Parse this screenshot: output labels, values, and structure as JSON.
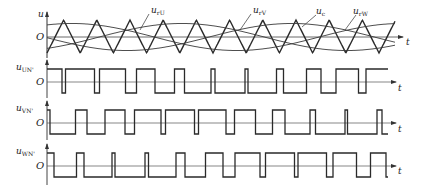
{
  "diagram": {
    "title": "",
    "panels": [
      {
        "id": "carrier",
        "axis_label": "u",
        "origin_label": "O",
        "time_label": "t",
        "curves": [
          {
            "name": "u_rU",
            "label_main": "u",
            "label_sub": "rU"
          },
          {
            "name": "u_rV",
            "label_main": "u",
            "label_sub": "rV"
          },
          {
            "name": "u_c",
            "label_main": "u",
            "label_sub": "c"
          },
          {
            "name": "u_rW",
            "label_main": "u",
            "label_sub": "rW"
          }
        ]
      },
      {
        "id": "uUN",
        "axis_label_main": "u",
        "axis_label_sub": "UN'",
        "origin_label": "O",
        "time_label": "t"
      },
      {
        "id": "uVN",
        "axis_label_main": "u",
        "axis_label_sub": "VN'",
        "origin_label": "O",
        "time_label": "t"
      },
      {
        "id": "uWN",
        "axis_label_main": "u",
        "axis_label_sub": "WN'",
        "origin_label": "O",
        "time_label": "t"
      }
    ],
    "colors": {
      "line": "#2a2a2a",
      "axis": "#444444",
      "background": "#ffffff"
    }
  }
}
